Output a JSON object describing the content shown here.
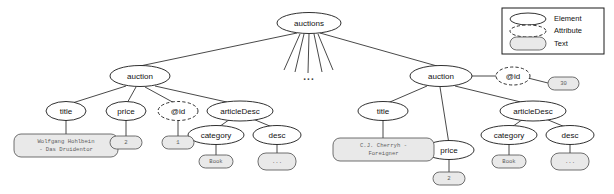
{
  "diagram": {
    "type": "xml-dom-tree",
    "root": {
      "label": "auctions",
      "kind": "element"
    },
    "ellipsis_marker": "...",
    "left_auction": {
      "label": "auction",
      "children": {
        "title": {
          "label": "title",
          "value": "Wolfgang Hohlbein\n- Das Druidentor"
        },
        "title_line1": "Wolfgang Hohlbein",
        "title_line2": "- Das Druidentor",
        "price": {
          "label": "price",
          "value": "2"
        },
        "id": {
          "label": "@id",
          "value": "1"
        },
        "articleDesc": {
          "label": "articleDesc",
          "category": {
            "label": "category",
            "value": "Book"
          },
          "desc": {
            "label": "desc",
            "value": "..."
          }
        }
      }
    },
    "right_auction": {
      "label": "auction",
      "id": {
        "label": "@id",
        "value": "30"
      },
      "children": {
        "title": {
          "label": "title",
          "value": "C.J. Cherryh -\nForeigner"
        },
        "title_line1": "C.J. Cherryh -",
        "title_line2": "Foreigner",
        "price": {
          "label": "price",
          "value": "2"
        },
        "articleDesc": {
          "label": "articleDesc",
          "category": {
            "label": "category",
            "value": "Book"
          },
          "desc": {
            "label": "desc",
            "value": "..."
          }
        }
      }
    }
  },
  "legend": {
    "items": [
      {
        "label": "Element",
        "shape": "ellipse-solid"
      },
      {
        "label": "Attribute",
        "shape": "ellipse-dashed"
      },
      {
        "label": "Text",
        "shape": "rounded-rect-filled"
      }
    ]
  },
  "colors": {
    "stroke": "#1a1a1a",
    "text_node_fill": "#e9e9e9",
    "text_node_stroke": "#4d4d4d",
    "text_node_label": "#5d5d5d",
    "background": "#ffffff"
  }
}
